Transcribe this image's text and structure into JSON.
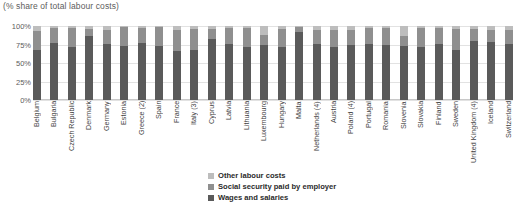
{
  "chart_data": {
    "type": "bar",
    "subtype": "stacked-percentage",
    "title": "(% share of total labour costs)",
    "xlabel": "",
    "ylabel": "",
    "ylim": [
      0,
      100
    ],
    "ytick_labels": [
      "100%",
      "75%",
      "50%",
      "25%",
      "0%"
    ],
    "ytick_values": [
      100,
      75,
      50,
      25,
      0
    ],
    "grid": true,
    "legend_position": "bottom-center",
    "categories": [
      "Belgium",
      "Bulgaria",
      "Czech Republic",
      "Denmark",
      "Germany",
      "Estonia",
      "Greece (2)",
      "Spain",
      "France",
      "Italy (3)",
      "Cyprus",
      "Latvia",
      "Lithuania",
      "Luxembourg",
      "Hungary",
      "Malta",
      "Netherlands (4)",
      "Austria",
      "Poland (4)",
      "Portugal",
      "Romania",
      "Slovenia",
      "Slovakia",
      "Finland",
      "Sweden",
      "United Kingdom (4)",
      "Iceland",
      "Switzerland"
    ],
    "series": [
      {
        "name": "Wages and salaries",
        "color": "#5a5a5a",
        "values": [
          67,
          77,
          72,
          86,
          76,
          73,
          77,
          73,
          66,
          68,
          83,
          76,
          71,
          75,
          72,
          92,
          76,
          72,
          74,
          76,
          74,
          73,
          72,
          76,
          67,
          80,
          79,
          76
        ]
      },
      {
        "name": "Social security paid by employer",
        "color": "#8f8f8f",
        "values": [
          26,
          21,
          26,
          10,
          19,
          26,
          20,
          25,
          29,
          28,
          13,
          22,
          27,
          13,
          24,
          6,
          18,
          23,
          20,
          21,
          24,
          14,
          26,
          21,
          29,
          16,
          16,
          18
        ]
      },
      {
        "name": "Other labour costs",
        "color": "#bdbdbd",
        "values": [
          7,
          2,
          2,
          4,
          5,
          1,
          3,
          2,
          5,
          4,
          4,
          2,
          2,
          12,
          4,
          2,
          6,
          5,
          6,
          3,
          2,
          13,
          2,
          3,
          4,
          4,
          5,
          6
        ]
      }
    ]
  },
  "legend": {
    "entries": [
      {
        "label": "Other labour costs",
        "color": "#bdbdbd"
      },
      {
        "label": "Social security paid by employer",
        "color": "#8f8f8f"
      },
      {
        "label": "Wages and salaries",
        "color": "#5a5a5a"
      }
    ]
  }
}
